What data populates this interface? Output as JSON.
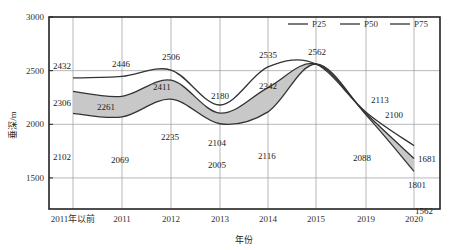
{
  "chart_data": {
    "type": "line",
    "title": "",
    "xlabel": "年份",
    "ylabel": "垂深/m",
    "categories": [
      "2011年以前",
      "2011",
      "2012",
      "2013",
      "2014",
      "2015",
      "2019",
      "2020"
    ],
    "yticks": [
      1500,
      2000,
      2500,
      3000
    ],
    "ylim": [
      1210,
      3000
    ],
    "grid": true,
    "legend_position": "top-right",
    "shaded_band": {
      "between": [
        "P50",
        "P25"
      ],
      "color": "#c8c8c8"
    },
    "series": [
      {
        "name": "P25",
        "values": [
          2432,
          2446,
          2506,
          2180,
          2535,
          2562,
          2113,
          1801
        ],
        "color": "#333333"
      },
      {
        "name": "P50",
        "values": [
          2306,
          2261,
          2411,
          2104,
          2342,
          2562,
          2100,
          1681
        ],
        "color": "#333333"
      },
      {
        "name": "P75",
        "values": [
          2102,
          2069,
          2235,
          2005,
          2116,
          2562,
          2088,
          1562
        ],
        "color": "#333333"
      }
    ]
  },
  "legend": [
    {
      "label": "P25"
    },
    {
      "label": "P50"
    },
    {
      "label": "P75"
    }
  ],
  "axes": {
    "x_title": "年份",
    "y_title": "垂深/m"
  }
}
